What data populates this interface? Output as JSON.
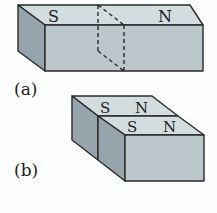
{
  "figure_a": {
    "caption": "(a)",
    "pole_left": "S",
    "pole_right": "N"
  },
  "figure_b": {
    "caption": "(b)",
    "back_pole_left": "S",
    "back_pole_right": "N",
    "front_pole_left": "S",
    "front_pole_right": "N"
  },
  "colors": {
    "top_face": "#d3dcdf",
    "front_face": "#bcc7cc",
    "side_face": "#97a4ab",
    "edge": "#2a2a2a"
  }
}
